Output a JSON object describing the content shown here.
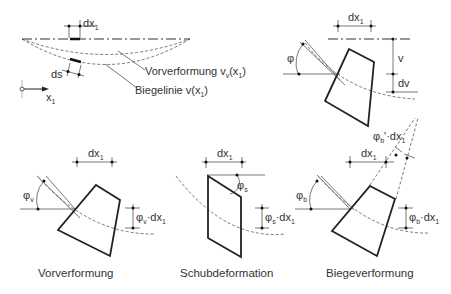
{
  "figure": {
    "overview": {
      "dx_label": "dx",
      "dx_sub": "1",
      "ds_label": "ds",
      "x_axis_label": "x",
      "x_axis_sub": "1",
      "predeformation_label": "Vorverformung v",
      "predeformation_sub": "v",
      "predeformation_arg": "(x",
      "predeformation_arg_sub": "1",
      "predeformation_close": ")",
      "bending_line_label": "Biegelinie v(x",
      "bending_line_sub": "1",
      "bending_line_close": ")"
    },
    "element_detail": {
      "dx_label": "dx",
      "dx_sub": "1",
      "phi_label": "φ",
      "v_label": "v",
      "dv_label": "dv"
    },
    "panels": [
      {
        "caption": "Vorverformung",
        "dx_label": "dx",
        "dx_sub": "1",
        "angle_label": "φ",
        "angle_sub": "v",
        "offset_label": "φ",
        "offset_sub": "v",
        "offset_tail": "·dx",
        "offset_tail_sub": "1"
      },
      {
        "caption": "Schubdeformation",
        "dx_label": "dx",
        "dx_sub": "1",
        "angle_label": "φ",
        "angle_sub": "s",
        "offset_label": "φ",
        "offset_sub": "s",
        "offset_tail": "·dx",
        "offset_tail_sub": "1"
      },
      {
        "caption": "Biegeverformung",
        "dx_label": "dx",
        "dx_sub": "1",
        "angle_label": "φ",
        "angle_sub": "b",
        "offset_label": "φ",
        "offset_sub": "b",
        "offset_tail": "·dx",
        "offset_tail_sub": "1",
        "top_label": "φ",
        "top_sub": "b",
        "top_tail": "'·dx",
        "top_tail_sub": "1"
      }
    ]
  }
}
